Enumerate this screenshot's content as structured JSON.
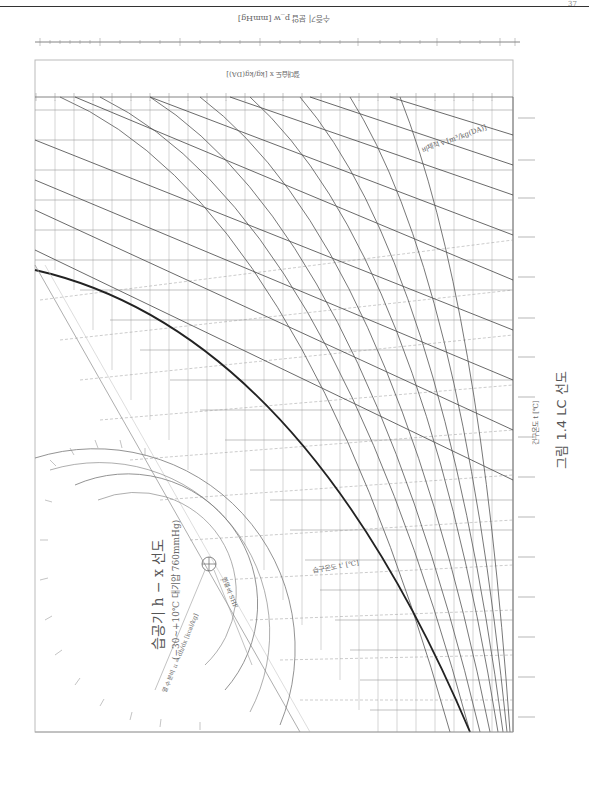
{
  "page": {
    "page_mark": "37"
  },
  "figure": {
    "caption": "그림 1.4 LC 선도",
    "title": "습공기 h − x 선도",
    "subtitle": "(−30∼+10℃ 대기압 760mmHg)"
  },
  "axes": {
    "top_scale_label": "수증기 분압 p_w [mmHg]",
    "top_scale_ticks": [
      "3.0",
      "2.5",
      "2.0",
      "1.5",
      "1.0",
      "0.5",
      "0.1"
    ],
    "humidity_scale_label": "절대습도 x [kg/kg(DA)]",
    "humidity_ticks": [
      "0.0025",
      "0.0024",
      "0.0023",
      "0.0022",
      "0.0021",
      "0.0020",
      "0.0019",
      "0.0018",
      "0.0017",
      "0.0016",
      "0.0015",
      "0.0014",
      "0.0013",
      "0.0012",
      "0.0011",
      "0.0010",
      "0.0009",
      "0.0008",
      "0.0007",
      "0.0006",
      "0.0005",
      "0.0004",
      "0.0003",
      "0.0002",
      "0.0001"
    ],
    "specific_volume_label": "비체적 v [m³/kg(DA)]",
    "specific_volume_ticks": [
      "0.80",
      "0.79",
      "0.78",
      "0.77",
      "0.76",
      "0.75",
      "0.74",
      "0.73",
      "0.72",
      "0.71",
      "0.70",
      "0.69",
      "0.68",
      "0.67",
      "0.66",
      "0.65",
      "0.64"
    ],
    "wet_bulb_label": "습구온도 t' [℃]",
    "dry_bulb_label": "건구온도 t [℃]",
    "enthalpy_label": "비엔탈피 h [kcal/kg(DA)]",
    "corner_mark": "t, φ, i, x\n1987"
  },
  "protractor": {
    "moisture_ratio_label": "열수분비 u = dh/dx [kcal/kg]",
    "shf_label": "현열비 SHF",
    "outer_ticks": [
      "−1000",
      "−500",
      "−200",
      "0",
      "200",
      "500",
      "1000",
      "2000",
      "5000",
      "10000",
      "∞"
    ],
    "inner_ticks": [
      "−1.0",
      "−0.5",
      "0",
      "0.5",
      "0.8",
      "1.0"
    ]
  },
  "style": {
    "line_color": "#333333",
    "grid_color": "#999999",
    "paper_color": "#ffffff"
  }
}
